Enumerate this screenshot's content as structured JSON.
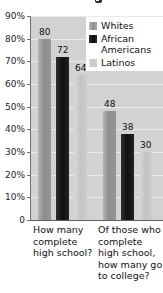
{
  "chart_data": {
    "type": "bar",
    "title": "",
    "xlabel": "",
    "ylabel": "",
    "ylim": [
      0,
      90
    ],
    "grid": true,
    "legend_position": "top-right",
    "categories": [
      "How many complete high school?",
      "Of those who complete high school, how many go to college?"
    ],
    "series": [
      {
        "name": "Whites",
        "color": "#8e8e8e",
        "values": [
          80,
          48
        ]
      },
      {
        "name": "African Americans",
        "color": "#101010",
        "values": [
          72,
          38
        ]
      },
      {
        "name": "Latinos",
        "color": "#c8c8c8",
        "values": [
          64,
          30
        ]
      }
    ],
    "y_ticks": [
      "0",
      "10%",
      "20%",
      "30%",
      "40%",
      "50%",
      "60%",
      "70%",
      "80%",
      "90%"
    ],
    "y_tick_values": [
      0,
      10,
      20,
      30,
      40,
      50,
      60,
      70,
      80,
      90
    ],
    "data_labels": [
      "80",
      "72",
      "64",
      "48",
      "38",
      "30"
    ]
  },
  "legend": {
    "items": [
      {
        "label": "Whites"
      },
      {
        "label": "African Americans"
      },
      {
        "label": "Latinos"
      }
    ]
  },
  "axes": {
    "y": {
      "ticks": [
        {
          "label": "90%",
          "value": 90
        },
        {
          "label": "80%",
          "value": 80
        },
        {
          "label": "70%",
          "value": 70
        },
        {
          "label": "60%",
          "value": 60
        },
        {
          "label": "50%",
          "value": 50
        },
        {
          "label": "40%",
          "value": 40
        },
        {
          "label": "30%",
          "value": 30
        },
        {
          "label": "20%",
          "value": 20
        },
        {
          "label": "10%",
          "value": 10
        },
        {
          "label": "0",
          "value": 0
        }
      ]
    },
    "x": {
      "categories": [
        {
          "label": "How many complete high school?"
        },
        {
          "label": "Of those who complete high school, how many go to college?"
        }
      ]
    }
  }
}
